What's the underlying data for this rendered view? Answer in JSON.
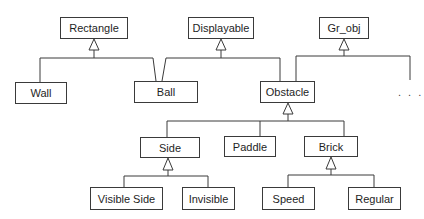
{
  "diagram": {
    "type": "UML class inheritance hierarchy",
    "classes": [
      {
        "id": "rectangle",
        "label": "Rectangle"
      },
      {
        "id": "displayable",
        "label": "Displayable"
      },
      {
        "id": "gr_obj",
        "label": "Gr_obj"
      },
      {
        "id": "wall",
        "label": "Wall"
      },
      {
        "id": "ball",
        "label": "Ball"
      },
      {
        "id": "obstacle",
        "label": "Obstacle"
      },
      {
        "id": "side",
        "label": "Side"
      },
      {
        "id": "paddle",
        "label": "Paddle"
      },
      {
        "id": "brick",
        "label": "Brick"
      },
      {
        "id": "visible_side",
        "label": "Visible Side"
      },
      {
        "id": "invisible",
        "label": "Invisible"
      },
      {
        "id": "speed",
        "label": "Speed"
      },
      {
        "id": "regular",
        "label": "Regular"
      }
    ],
    "more_indicator": ". . .",
    "inheritance": [
      {
        "parent": "Rectangle",
        "children": [
          "Wall",
          "Ball"
        ]
      },
      {
        "parent": "Displayable",
        "children": [
          "Ball",
          "Obstacle"
        ]
      },
      {
        "parent": "Gr_obj",
        "children": [
          "Obstacle",
          "..."
        ]
      },
      {
        "parent": "Obstacle",
        "children": [
          "Side",
          "Paddle",
          "Brick"
        ]
      },
      {
        "parent": "Side",
        "children": [
          "Visible Side",
          "Invisible"
        ]
      },
      {
        "parent": "Brick",
        "children": [
          "Speed",
          "Regular"
        ]
      }
    ],
    "colors": {
      "line": "#3a3a3a",
      "background": "#ffffff",
      "text": "#1e1e1e"
    }
  }
}
